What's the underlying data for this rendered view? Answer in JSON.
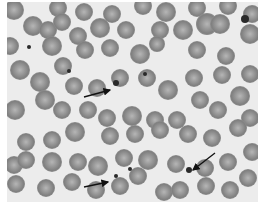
{
  "figure": {
    "background_color": "#ececec",
    "cell_color": "#8a8a8a",
    "cell_center_color": "#b4b4b4",
    "platelet_color": "#2a2a2a",
    "arrow_color": "#111111",
    "panel": {
      "x": 7,
      "y": 2,
      "w": 251,
      "h": 200
    },
    "cells": [
      [
        14,
        10,
        10
      ],
      [
        33,
        26,
        10
      ],
      [
        58,
        8,
        9
      ],
      [
        84,
        12,
        9
      ],
      [
        112,
        14,
        9
      ],
      [
        143,
        6,
        9
      ],
      [
        166,
        12,
        10
      ],
      [
        197,
        8,
        9
      ],
      [
        228,
        6,
        9
      ],
      [
        252,
        14,
        9
      ],
      [
        10,
        46,
        9
      ],
      [
        48,
        30,
        9
      ],
      [
        62,
        22,
        9
      ],
      [
        78,
        36,
        9
      ],
      [
        100,
        28,
        10
      ],
      [
        126,
        30,
        9
      ],
      [
        160,
        30,
        9
      ],
      [
        183,
        30,
        10
      ],
      [
        207,
        24,
        11
      ],
      [
        220,
        24,
        10
      ],
      [
        250,
        34,
        10
      ],
      [
        20,
        70,
        10
      ],
      [
        52,
        46,
        10
      ],
      [
        63,
        66,
        9
      ],
      [
        85,
        50,
        9
      ],
      [
        110,
        48,
        9
      ],
      [
        140,
        54,
        10
      ],
      [
        157,
        44,
        8
      ],
      [
        197,
        50,
        9
      ],
      [
        226,
        56,
        9
      ],
      [
        250,
        74,
        9
      ],
      [
        40,
        82,
        10
      ],
      [
        74,
        86,
        9
      ],
      [
        97,
        88,
        9
      ],
      [
        120,
        78,
        9
      ],
      [
        147,
        78,
        9
      ],
      [
        168,
        90,
        10
      ],
      [
        194,
        78,
        9
      ],
      [
        222,
        75,
        9
      ],
      [
        240,
        96,
        10
      ],
      [
        15,
        110,
        10
      ],
      [
        45,
        100,
        10
      ],
      [
        62,
        110,
        9
      ],
      [
        88,
        110,
        9
      ],
      [
        107,
        118,
        9
      ],
      [
        132,
        116,
        10
      ],
      [
        155,
        120,
        9
      ],
      [
        177,
        120,
        9
      ],
      [
        200,
        100,
        9
      ],
      [
        218,
        110,
        9
      ],
      [
        250,
        118,
        9
      ],
      [
        26,
        142,
        9
      ],
      [
        52,
        140,
        9
      ],
      [
        75,
        132,
        10
      ],
      [
        110,
        136,
        9
      ],
      [
        135,
        134,
        9
      ],
      [
        160,
        130,
        9
      ],
      [
        188,
        134,
        9
      ],
      [
        212,
        138,
        9
      ],
      [
        238,
        128,
        9
      ],
      [
        252,
        152,
        9
      ],
      [
        14,
        165,
        9
      ],
      [
        26,
        160,
        9
      ],
      [
        52,
        162,
        10
      ],
      [
        78,
        162,
        9
      ],
      [
        98,
        166,
        10
      ],
      [
        124,
        158,
        9
      ],
      [
        148,
        160,
        10
      ],
      [
        176,
        164,
        9
      ],
      [
        205,
        168,
        9
      ],
      [
        228,
        162,
        9
      ],
      [
        248,
        178,
        9
      ],
      [
        16,
        184,
        9
      ],
      [
        46,
        188,
        9
      ],
      [
        72,
        182,
        9
      ],
      [
        96,
        190,
        9
      ],
      [
        120,
        186,
        9
      ],
      [
        138,
        176,
        9
      ],
      [
        164,
        192,
        9
      ],
      [
        180,
        190,
        9
      ],
      [
        206,
        186,
        9
      ],
      [
        230,
        190,
        9
      ]
    ],
    "platelets": [
      [
        29,
        47,
        2
      ],
      [
        69,
        71,
        2
      ],
      [
        116,
        83,
        3
      ],
      [
        145,
        74,
        2
      ],
      [
        245,
        19,
        4
      ],
      [
        130,
        169,
        2
      ],
      [
        116,
        176,
        2
      ],
      [
        189,
        170,
        3
      ]
    ],
    "arrows": [
      {
        "label": "arrow-1",
        "x1": 84,
        "y1": 97,
        "x2": 110,
        "y2": 90
      },
      {
        "label": "arrow-2",
        "x1": 84,
        "y1": 187,
        "x2": 108,
        "y2": 182
      },
      {
        "label": "arrow-3",
        "x1": 215,
        "y1": 153,
        "x2": 193,
        "y2": 170
      }
    ]
  }
}
